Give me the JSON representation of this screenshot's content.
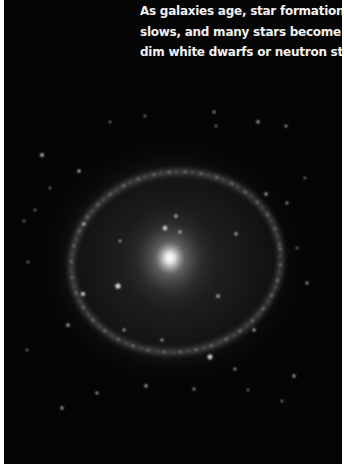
{
  "caption": {
    "lines": [
      "As galaxies age, star formation",
      "slows, and many stars become",
      "dim white dwarfs or neutron stars."
    ]
  },
  "image": {
    "subject": "spiral-ring-galaxy",
    "background_color": "#050505",
    "core_color": "#ffffff"
  }
}
